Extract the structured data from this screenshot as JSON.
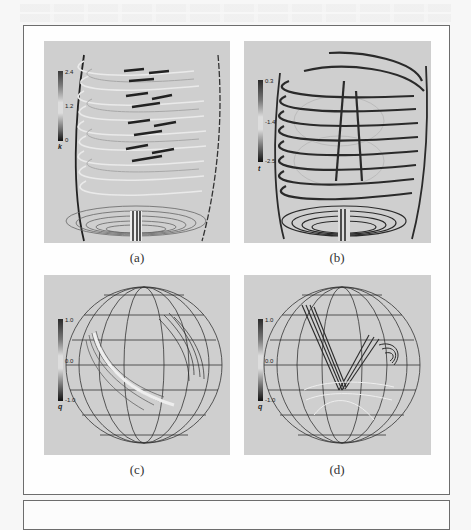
{
  "figure": {
    "panels": [
      {
        "id": "a",
        "caption": "(a)",
        "kind": "field-lines-helical",
        "colorbar": {
          "variable": "k",
          "ticks": [
            "2.4",
            "1.2",
            "0"
          ]
        }
      },
      {
        "id": "b",
        "caption": "(b)",
        "kind": "field-lines-helical",
        "colorbar": {
          "variable": "t",
          "ticks": [
            "0.3",
            "-1.4",
            "-2.5"
          ]
        }
      },
      {
        "id": "c",
        "caption": "(c)",
        "kind": "sphere-grid-field-lines",
        "colorbar": {
          "variable": "q",
          "ticks": [
            "1.0",
            "0.0",
            "-1.0"
          ]
        }
      },
      {
        "id": "d",
        "caption": "(d)",
        "kind": "sphere-grid-field-lines",
        "colorbar": {
          "variable": "q",
          "ticks": [
            "1.0",
            "0.0",
            "-1.0"
          ]
        }
      }
    ]
  },
  "colors": {
    "panel_bg": "#cfcfcf",
    "frame_border": "#6d6d6d",
    "line_dark": "#2a2a2a",
    "line_light": "#e8e8e8"
  }
}
